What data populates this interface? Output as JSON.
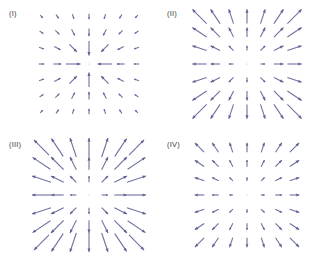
{
  "figure": {
    "background_color": "#ffffff",
    "width": 316,
    "height": 261,
    "panel_layout": "2x2"
  },
  "panels": [
    {
      "label": "(I)",
      "position": "top-left",
      "origin": {
        "x": 0,
        "y": 0
      }
    },
    {
      "label": "(II)",
      "position": "top-right",
      "origin": {
        "x": 158,
        "y": 0
      }
    },
    {
      "label": "(III)",
      "position": "bottom-left",
      "origin": {
        "x": 0,
        "y": 131
      }
    },
    {
      "label": "(IV)",
      "position": "bottom-right",
      "origin": {
        "x": 158,
        "y": 131
      }
    }
  ],
  "chart_data": {
    "type": "scatter",
    "subtype": "quiver-vector-field-grid",
    "title": "",
    "xlabel": "",
    "ylabel": "",
    "grid": false,
    "legend": null,
    "arrow_color": "#5a5f93",
    "arrow_linewidth": 1.1,
    "grid_shape": [
      7,
      7
    ],
    "x": [
      -3,
      -2,
      -1,
      0,
      1,
      2,
      3
    ],
    "y": [
      -3,
      -2,
      -1,
      0,
      1,
      2,
      3
    ],
    "xlim": [
      -3.6,
      3.6
    ],
    "ylim": [
      -3.6,
      3.6
    ],
    "panels": [
      {
        "label": "(I)",
        "direction": "inward",
        "radial_sign": -1,
        "magnitude_law": "decreasing-with-radius",
        "scale": 0.92,
        "exponent": -0.9,
        "description": "Vectors point toward the center; length decreases as distance from the center grows (sink, 1/r falloff)."
      },
      {
        "label": "(II)",
        "direction": "outward",
        "radial_sign": 1,
        "magnitude_law": "increasing-with-radius",
        "scale": 0.3,
        "exponent": 1.0,
        "description": "Vectors point away from the center; length grows linearly with distance from the center (source, r growth)."
      },
      {
        "label": "(III)",
        "direction": "outward",
        "radial_sign": 1,
        "magnitude_law": "increasing-with-radius-steep",
        "scale": 0.4,
        "exponent": 1.0,
        "description": "Vectors point away from the center; length grows with distance, longer than panel II."
      },
      {
        "label": "(IV)",
        "direction": "outward",
        "radial_sign": 1,
        "magnitude_law": "increasing-with-radius-shallow",
        "scale": 0.24,
        "exponent": 0.85,
        "description": "Vectors point away from the center; length grows modestly with distance, shorter than panel III."
      }
    ]
  }
}
